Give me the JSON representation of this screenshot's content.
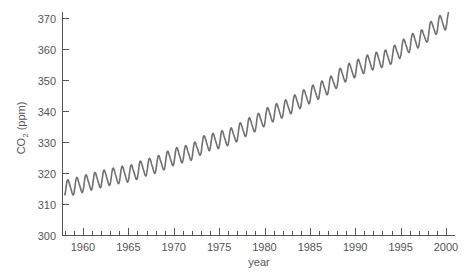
{
  "chart_data": {
    "type": "line",
    "title": "",
    "xlabel": "year",
    "ylabel": "CO2 (ppm)",
    "ylabel_main": "CO",
    "ylabel_sub": "2",
    "ylabel_unit": " (ppm)",
    "xlim": [
      1957.7,
      2001
    ],
    "ylim": [
      300,
      372
    ],
    "x_ticks": [
      1960,
      1965,
      1970,
      1975,
      1980,
      1985,
      1990,
      1995,
      2000
    ],
    "x_tick_labels": [
      "1960",
      "1965",
      "1970",
      "1975",
      "1980",
      "1985",
      "1990",
      "1995",
      "2000"
    ],
    "y_ticks": [
      300,
      310,
      320,
      330,
      340,
      350,
      360,
      370
    ],
    "y_tick_labels": [
      "300",
      "310",
      "320",
      "330",
      "340",
      "350",
      "360",
      "370"
    ],
    "grid": false,
    "legend": null,
    "line_color": "#707070",
    "axis_color": "#555555",
    "series": [
      {
        "name": "Atmospheric CO2 (seasonal)",
        "annual_mean": {
          "x": [
            1958,
            1959,
            1960,
            1961,
            1962,
            1963,
            1964,
            1965,
            1966,
            1967,
            1968,
            1969,
            1970,
            1971,
            1972,
            1973,
            1974,
            1975,
            1976,
            1977,
            1978,
            1979,
            1980,
            1981,
            1982,
            1983,
            1984,
            1985,
            1986,
            1987,
            1988,
            1989,
            1990,
            1991,
            1992,
            1993,
            1994,
            1995,
            1996,
            1997,
            1998,
            1999,
            2000
          ],
          "values": [
            315.3,
            316.0,
            316.9,
            317.6,
            318.4,
            319.0,
            319.6,
            320.0,
            321.4,
            322.2,
            323.1,
            324.6,
            325.7,
            326.3,
            327.5,
            329.7,
            330.2,
            331.1,
            332.0,
            333.8,
            335.4,
            336.8,
            338.7,
            339.9,
            341.1,
            342.8,
            344.4,
            345.9,
            347.2,
            348.9,
            351.5,
            352.9,
            354.2,
            355.6,
            356.4,
            357.1,
            358.8,
            360.8,
            362.6,
            363.7,
            366.7,
            368.4,
            369.5
          ]
        },
        "seasonal_amplitude": 3.0,
        "start": {
          "x": 1958.0,
          "y": 316.0
        },
        "end": {
          "x": 2000.3,
          "y": 367.5
        }
      }
    ]
  }
}
